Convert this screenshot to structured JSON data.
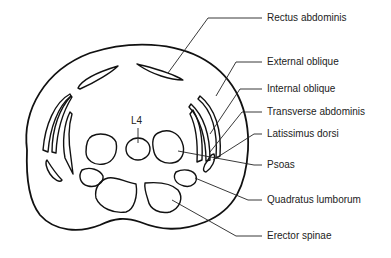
{
  "diagram": {
    "vertebra_label": "L4",
    "labels": [
      {
        "id": "rectus-abdominis",
        "text": "Rectus abdominis",
        "x": 267,
        "y": 14
      },
      {
        "id": "external-oblique",
        "text": "External oblique",
        "x": 267,
        "y": 57
      },
      {
        "id": "internal-oblique",
        "text": "Internal oblique",
        "x": 267,
        "y": 84
      },
      {
        "id": "transverse-abdominis",
        "text": "Transverse abdominis",
        "x": 267,
        "y": 107
      },
      {
        "id": "latissimus-dorsi",
        "text": "Latissimus dorsi",
        "x": 267,
        "y": 128
      },
      {
        "id": "psoas",
        "text": "Psoas",
        "x": 267,
        "y": 159
      },
      {
        "id": "quadratus-lumborum",
        "text": "Quadratus lumborum",
        "x": 267,
        "y": 194
      },
      {
        "id": "erector-spinae",
        "text": "Erector spinae",
        "x": 267,
        "y": 230
      }
    ],
    "colors": {
      "line": "#111111",
      "text": "#222222",
      "background": "#ffffff"
    }
  }
}
